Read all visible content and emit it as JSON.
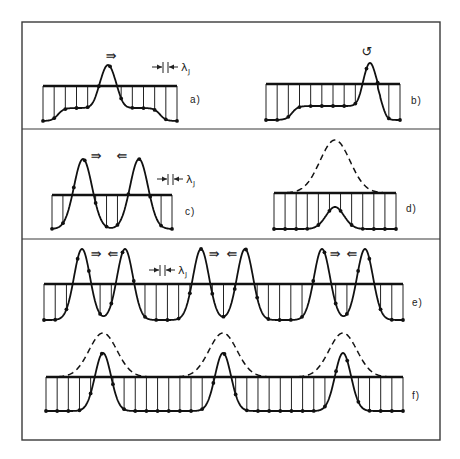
{
  "figure": {
    "frame": {
      "x": 22,
      "y": 22,
      "w": 418,
      "h": 418
    },
    "dividers": [
      129,
      239
    ],
    "colors": {
      "ink": "#111111",
      "frame": "#3a3a3a",
      "background": "#ffffff"
    },
    "symbols": {
      "arrow_right": "⇛",
      "arrow_left": "⇚",
      "rotate": "↺",
      "lambda": "λ",
      "lambda_sub": "J"
    },
    "panels": [
      {
        "id": "a",
        "label": "a)",
        "label_pos": [
          190,
          103
        ],
        "baseline_y": 86,
        "bottom_y": 121,
        "x0": 43,
        "x1": 177,
        "peaks": [
          {
            "x": 108,
            "top": 65,
            "width": 7
          }
        ],
        "arrows": [
          {
            "glyph": "⇛",
            "x": 111,
            "y": 60
          }
        ],
        "lambda_marker": {
          "x": 166,
          "y": 67
        }
      },
      {
        "id": "b",
        "label": "b)",
        "label_pos": [
          411,
          104
        ],
        "baseline_y": 84,
        "bottom_y": 120,
        "x0": 266,
        "x1": 400,
        "peaks": [
          {
            "x": 370,
            "top": 63,
            "width": 6
          }
        ],
        "arrows": [
          {
            "glyph": "↺",
            "x": 367,
            "y": 56
          }
        ]
      },
      {
        "id": "c",
        "label": "c)",
        "label_pos": [
          185,
          215
        ],
        "baseline_y": 195,
        "bottom_y": 229,
        "x0": 52,
        "x1": 172,
        "peaks": [
          {
            "x": 83,
            "top": 159,
            "width": 7
          },
          {
            "x": 139,
            "top": 159,
            "width": 7
          }
        ],
        "arrows": [
          {
            "glyph": "⇛",
            "x": 96,
            "y": 160
          },
          {
            "glyph": "⇚",
            "x": 122,
            "y": 160
          }
        ],
        "lambda_marker": {
          "x": 171,
          "y": 179
        }
      },
      {
        "id": "d",
        "label": "d)",
        "label_pos": [
          406,
          212
        ],
        "baseline_y": 193,
        "bottom_y": 229,
        "x0": 274,
        "x1": 396,
        "dashed_peak": {
          "x": 335,
          "top": 140,
          "width": 15
        },
        "small_bump": {
          "x": 335,
          "top": 207,
          "width": 9
        }
      },
      {
        "id": "e",
        "label": "e)",
        "label_pos": [
          412,
          306
        ],
        "baseline_y": 284,
        "bottom_y": 320,
        "x0": 44,
        "x1": 403,
        "peaks": [
          {
            "x": 82,
            "top": 249,
            "width": 6
          },
          {
            "x": 125,
            "top": 249,
            "width": 6
          },
          {
            "x": 201,
            "top": 249,
            "width": 6
          },
          {
            "x": 245,
            "top": 249,
            "width": 6
          },
          {
            "x": 322,
            "top": 249,
            "width": 6
          },
          {
            "x": 365,
            "top": 249,
            "width": 6
          }
        ],
        "arrows": [
          {
            "glyph": "⇛",
            "x": 96,
            "y": 258
          },
          {
            "glyph": "⇚",
            "x": 113,
            "y": 258
          },
          {
            "glyph": "⇛",
            "x": 214,
            "y": 258
          },
          {
            "glyph": "⇚",
            "x": 232,
            "y": 258
          },
          {
            "glyph": "⇛",
            "x": 335,
            "y": 258
          },
          {
            "glyph": "⇚",
            "x": 352,
            "y": 258
          }
        ],
        "lambda_marker": {
          "x": 163,
          "y": 270
        }
      },
      {
        "id": "f",
        "label": "f)",
        "label_pos": [
          412,
          399
        ],
        "baseline_y": 377,
        "bottom_y": 411,
        "x0": 46,
        "x1": 403,
        "dashed_peaks": [
          {
            "x": 103,
            "top": 333,
            "width": 14
          },
          {
            "x": 223,
            "top": 333,
            "width": 14
          },
          {
            "x": 343,
            "top": 333,
            "width": 14
          }
        ],
        "peaks": [
          {
            "x": 103,
            "top": 353,
            "width": 7
          },
          {
            "x": 223,
            "top": 353,
            "width": 7
          },
          {
            "x": 343,
            "top": 353,
            "width": 7
          }
        ]
      }
    ]
  }
}
